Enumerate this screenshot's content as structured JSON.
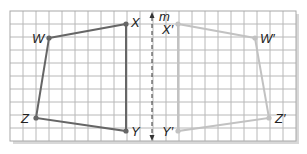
{
  "figure": {
    "type": "reflection-diagram",
    "grid": {
      "x0": 10,
      "y0": 11,
      "cols": 22,
      "rows": 10,
      "cell": 13,
      "line_color": "#b8b8b8",
      "border_color": "#a8a8a8",
      "shadow_color": "#d8d8d8"
    },
    "axis": {
      "label": "m",
      "x": 152,
      "y_top": 12,
      "y_bottom": 141,
      "color": "#333333"
    },
    "original": {
      "color": "#666666",
      "vertices": [
        {
          "name": "W",
          "label": "W",
          "x": 49,
          "y": 38
        },
        {
          "name": "X",
          "label": "X",
          "x": 126,
          "y": 24
        },
        {
          "name": "Y",
          "label": "Y",
          "x": 126,
          "y": 131
        },
        {
          "name": "Z",
          "label": "Z",
          "x": 36,
          "y": 118
        }
      ]
    },
    "image": {
      "color": "#c2c2c2",
      "vertices": [
        {
          "name": "W-prime",
          "label": "W′",
          "x": 255,
          "y": 38
        },
        {
          "name": "X-prime",
          "label": "X′",
          "x": 178,
          "y": 24
        },
        {
          "name": "Y-prime",
          "label": "Y′",
          "x": 178,
          "y": 131
        },
        {
          "name": "Z-prime",
          "label": "Z′",
          "x": 269,
          "y": 118
        }
      ]
    },
    "labels": [
      {
        "key": "W",
        "text": "W",
        "x": 32,
        "y": 43
      },
      {
        "key": "X",
        "text": "X",
        "x": 131,
        "y": 27
      },
      {
        "key": "Z",
        "text": "Z",
        "x": 21,
        "y": 123
      },
      {
        "key": "Y",
        "text": "Y",
        "x": 131,
        "y": 136
      },
      {
        "key": "m",
        "text": "m",
        "x": 159,
        "y": 21
      },
      {
        "key": "X-prime",
        "text": "X′",
        "x": 162,
        "y": 34
      },
      {
        "key": "W-prime",
        "text": "W′",
        "x": 260,
        "y": 43
      },
      {
        "key": "Z-prime",
        "text": "Z′",
        "x": 275,
        "y": 123
      },
      {
        "key": "Y-prime",
        "text": "Y′",
        "x": 162,
        "y": 136
      }
    ]
  }
}
